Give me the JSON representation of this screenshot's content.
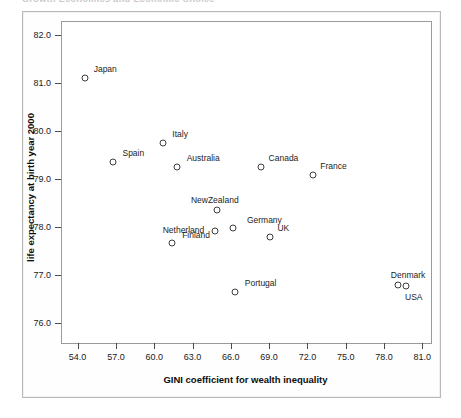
{
  "header": {
    "running_head": "Growth Economics and Economic Choice"
  },
  "chart_data": {
    "type": "scatter",
    "title": "",
    "xlabel": "GINI coefficient for wealth inequality",
    "ylabel": "life expectancy at birth year 2000",
    "xlim": [
      52.7,
      81.6
    ],
    "ylim": [
      75.6,
      82.3
    ],
    "xticks": [
      "54.0",
      "57.0",
      "60.0",
      "63.0",
      "66.0",
      "69.0",
      "72.0",
      "75.0",
      "78.0",
      "81.0"
    ],
    "yticks": [
      "76.0",
      "77.0",
      "78.0",
      "79.0",
      "80.0",
      "81.0",
      "82.0"
    ],
    "grid": false,
    "legend": "none",
    "marker": "open-circle",
    "marker_color": "#3d3d3d",
    "points": [
      {
        "label": "Japan",
        "x": 54.6,
        "y": 81.12,
        "label_dx": 20,
        "label_dy": -9
      },
      {
        "label": "Spain",
        "x": 56.8,
        "y": 79.36,
        "label_dx": 20,
        "label_dy": -9
      },
      {
        "label": "Italy",
        "x": 60.7,
        "y": 79.76,
        "label_dx": 17,
        "label_dy": -9
      },
      {
        "label": "Australia",
        "x": 61.8,
        "y": 79.26,
        "label_dx": 26,
        "label_dy": -9
      },
      {
        "label": "Finland",
        "x": 61.4,
        "y": 77.66,
        "label_dx": 24,
        "label_dy": -8
      },
      {
        "label": "Netherland",
        "x": 64.8,
        "y": 77.92,
        "label_dx": -32,
        "label_dy": -1
      },
      {
        "label": "NewZealand",
        "x": 64.9,
        "y": 78.36,
        "label_dx": -2,
        "label_dy": -10
      },
      {
        "label": "Germany",
        "x": 66.2,
        "y": 77.98,
        "label_dx": 31,
        "label_dy": -8
      },
      {
        "label": "Portugal",
        "x": 66.3,
        "y": 76.64,
        "label_dx": 26,
        "label_dy": -9
      },
      {
        "label": "Canada",
        "x": 68.4,
        "y": 79.26,
        "label_dx": 22,
        "label_dy": -9
      },
      {
        "label": "UK",
        "x": 69.1,
        "y": 77.8,
        "label_dx": 13,
        "label_dy": -9
      },
      {
        "label": "France",
        "x": 72.4,
        "y": 79.08,
        "label_dx": 21,
        "label_dy": -9
      },
      {
        "label": "Denmark",
        "x": 79.1,
        "y": 76.78,
        "label_dx": 10,
        "label_dy": -10
      },
      {
        "label": "USA",
        "x": 79.7,
        "y": 76.76,
        "label_dx": 8,
        "label_dy": 11
      }
    ]
  }
}
